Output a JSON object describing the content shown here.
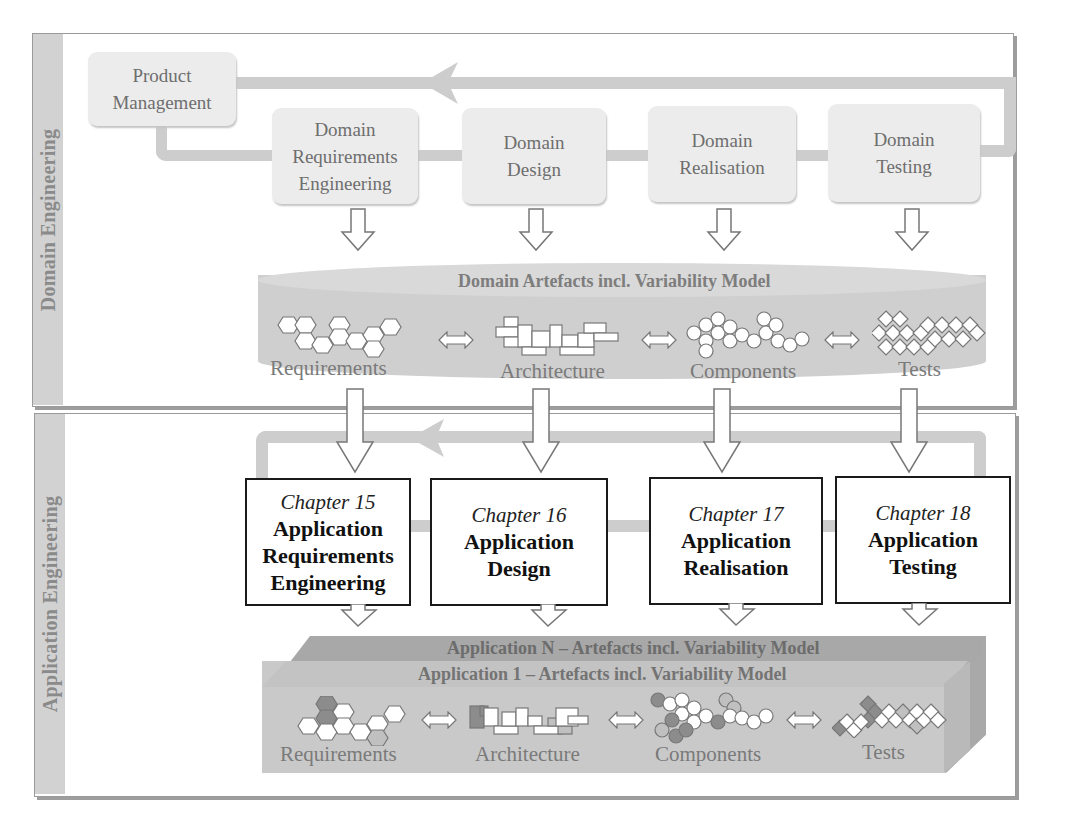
{
  "caption": "Figure caption (partially visible): ...uct line engineering framework...",
  "domain_engineering": {
    "side_label": "Domain Engineering",
    "product_management": "Product Management",
    "process_steps": [
      {
        "line1": "Domain",
        "line2": "Requirements",
        "line3": "Engineering"
      },
      {
        "line1": "Domain",
        "line2": "Design"
      },
      {
        "line1": "Domain",
        "line2": "Realisation"
      },
      {
        "line1": "Domain",
        "line2": "Testing"
      }
    ],
    "artefacts": {
      "title": "Domain Artefacts incl. Variability Model",
      "items": [
        "Requirements",
        "Architecture",
        "Components",
        "Tests"
      ]
    }
  },
  "application_engineering": {
    "side_label": "Application Engineering",
    "process_steps": [
      {
        "chapter": "Chapter 15",
        "line1": "Application",
        "line2": "Requirements",
        "line3": "Engineering"
      },
      {
        "chapter": "Chapter 16",
        "line1": "Application",
        "line2": "Design"
      },
      {
        "chapter": "Chapter 17",
        "line1": "Application",
        "line2": "Realisation"
      },
      {
        "chapter": "Chapter 18",
        "line1": "Application",
        "line2": "Testing"
      }
    ],
    "artefacts": {
      "title_n": "Application N – Artefacts incl. Variability Model",
      "title_1": "Application 1 – Artefacts incl. Variability Model",
      "items": [
        "Requirements",
        "Architecture",
        "Components",
        "Tests"
      ]
    }
  },
  "colors": {
    "frame_border": "#9a9a9a",
    "side_bar": "#d2d2d2",
    "process_box": "#ececec",
    "connector": "#cdcdcd",
    "artefact_body": "#cfcfcf",
    "chapter_border": "#1a1a1a",
    "app_n": "#a8a8a8",
    "app_1": "#c9c9c9",
    "variant_dark": "#8c8c8c"
  }
}
